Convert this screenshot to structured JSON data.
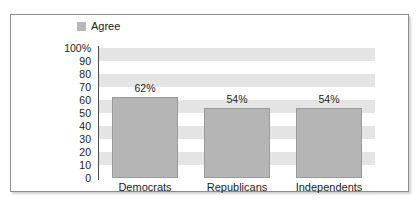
{
  "legend": {
    "swatch_icon": "legend-square-icon",
    "entries": [
      {
        "label": "Agree",
        "color": "#b8b8b8"
      }
    ]
  },
  "colors": {
    "bar_fill": "#b5b5b5",
    "bar_stroke": "#9a9a9a",
    "band_fill": "#e4e4e4",
    "plot_background": "#ffffff",
    "axis_line": "#4a4a4a",
    "frame_border": "#8d8d8d",
    "text": "#1c1c1c"
  },
  "chart_data": {
    "type": "bar",
    "title": "",
    "subtitle": "",
    "xlabel": "",
    "ylabel": "",
    "categories": [
      "Democrats",
      "Republicans",
      "Independents"
    ],
    "series": [
      {
        "name": "Agree",
        "values": [
          62,
          54,
          54
        ],
        "data_labels": [
          "62%",
          "54%",
          "54%"
        ],
        "color": "#b5b5b5"
      }
    ],
    "ylim": [
      0,
      100
    ],
    "y_tick_values": [
      100,
      90,
      80,
      70,
      60,
      50,
      40,
      30,
      20,
      10,
      0
    ],
    "y_tick_labels": [
      "100%",
      "90",
      "80",
      "70",
      "60",
      "50",
      "40",
      "30",
      "20",
      "10",
      "0"
    ],
    "grid": false,
    "banded_background": true,
    "band_interval": 10,
    "legend_position": "top-left"
  }
}
